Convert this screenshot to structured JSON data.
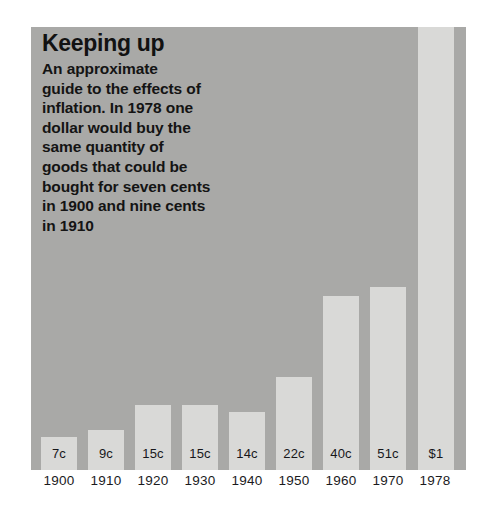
{
  "figure": {
    "background_color": "#ffffff",
    "panel_color": "#a9a9a7",
    "bar_color": "#d9d9d7",
    "text_color": "#121212"
  },
  "caption": {
    "title": "Keeping up",
    "body_lines": [
      "An approximate",
      "guide to the effects of",
      "inflation. In 1978 one",
      "dollar would buy the",
      "same quantity of",
      "goods that could be",
      "bought for seven cents",
      "in 1900 and nine cents",
      "in 1910"
    ]
  },
  "chart_data": {
    "type": "bar",
    "title": "Keeping up",
    "subtitle": "An approximate guide to the effects of inflation. In 1978 one dollar would buy the same quantity of goods that could be bought for seven cents in 1900 and nine cents in 1910",
    "xlabel": "",
    "ylabel": "",
    "grid": false,
    "legend": "none",
    "categories": [
      "1900",
      "1910",
      "1920",
      "1930",
      "1940",
      "1950",
      "1960",
      "1970",
      "1978"
    ],
    "value_labels": [
      "7c",
      "9c",
      "15c",
      "15c",
      "14c",
      "22c",
      "40c",
      "51c",
      "$1"
    ],
    "values": [
      7,
      9,
      15,
      15,
      14,
      22,
      40,
      51,
      100
    ],
    "unit": "cents",
    "ylim": [
      0,
      100
    ],
    "bars": [
      {
        "year": "1900",
        "label": "7c",
        "value": 7
      },
      {
        "year": "1910",
        "label": "9c",
        "value": 9
      },
      {
        "year": "1920",
        "label": "15c",
        "value": 15
      },
      {
        "year": "1930",
        "label": "15c",
        "value": 15
      },
      {
        "year": "1940",
        "label": "14c",
        "value": 14
      },
      {
        "year": "1950",
        "label": "22c",
        "value": 22
      },
      {
        "year": "1960",
        "label": "40c",
        "value": 40
      },
      {
        "year": "1970",
        "label": "51c",
        "value": 51
      },
      {
        "year": "1978",
        "label": "$1",
        "value": 100
      }
    ]
  },
  "layout": {
    "bar_left_px": [
      10,
      57,
      104,
      151,
      198,
      245,
      292,
      339,
      387
    ],
    "bar_width_px": 36,
    "bar_height_px": [
      33,
      40,
      65,
      65,
      58,
      93,
      174,
      183,
      443
    ],
    "tick_left_px": [
      0,
      47,
      94,
      141,
      188,
      235,
      282,
      329,
      376
    ],
    "tick_width_px": 56
  }
}
